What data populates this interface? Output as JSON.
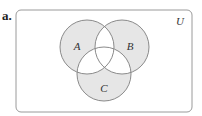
{
  "part_label": "a.",
  "universe": {
    "label": "U",
    "x": 16,
    "y": 10,
    "width": 176,
    "height": 102,
    "radius": 5,
    "stroke": "#9a9a9a"
  },
  "sets": [
    {
      "label": "A",
      "cx": 87,
      "cy": 47,
      "r": 27,
      "label_x": 77,
      "label_y": 47
    },
    {
      "label": "B",
      "cx": 122,
      "cy": 47,
      "r": 27,
      "label_x": 130,
      "label_y": 47
    },
    {
      "label": "C",
      "cx": 104,
      "cy": 74,
      "r": 27,
      "label_x": 104,
      "label_y": 89
    }
  ],
  "shaded_regions": [
    "A only",
    "B only",
    "C only"
  ],
  "colors": {
    "shade": "#e6e6e6",
    "circle_stroke": "#8a8a8a",
    "background": "#ffffff"
  }
}
